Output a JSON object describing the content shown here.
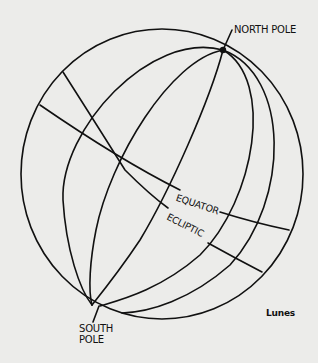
{
  "diagram": {
    "title": "Lunes",
    "labels": {
      "north_pole": "NORTH POLE",
      "south_pole": "SOUTH POLE",
      "equator": "EQUATOR",
      "ecliptic": "ECLIPTIC"
    },
    "caption": "Lunes",
    "colors": {
      "background": "#ececea",
      "stroke": "#111111"
    },
    "elements": {
      "sphere": "outer circle of celestial sphere",
      "meridians": 5,
      "great_circles": [
        "equator",
        "ecliptic"
      ]
    }
  }
}
